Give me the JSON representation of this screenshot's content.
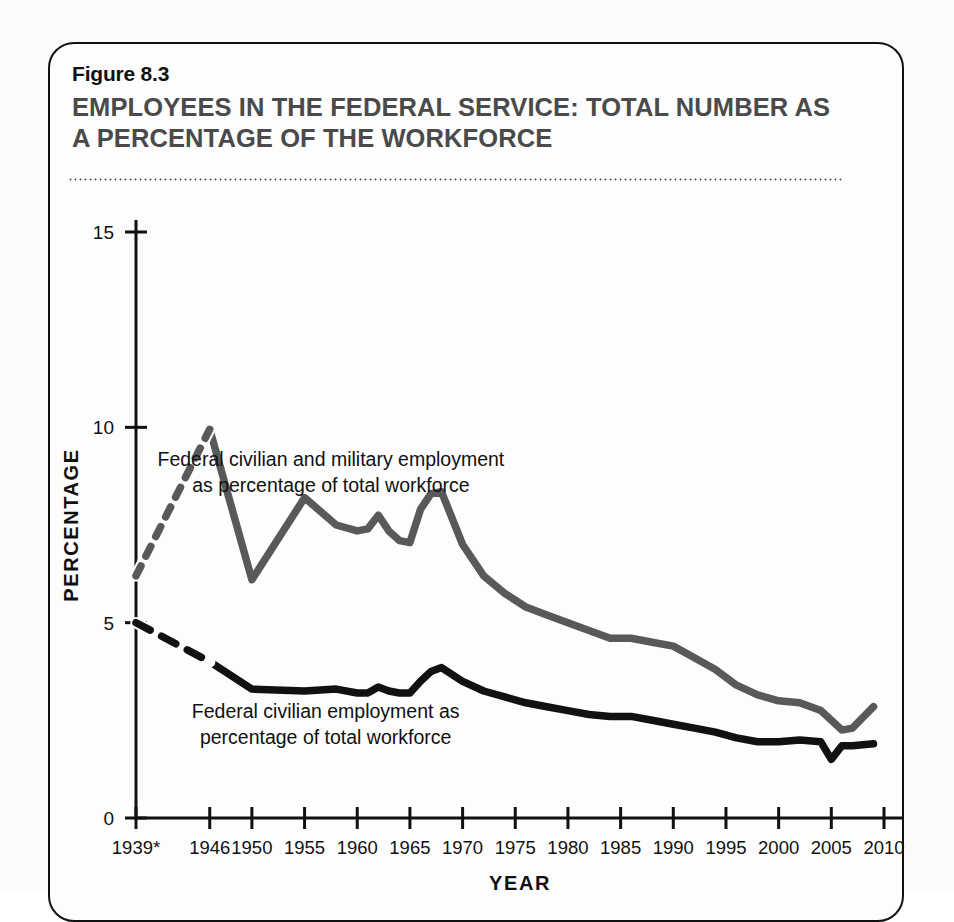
{
  "figure": {
    "number": "Figure 8.3",
    "title": "EMPLOYEES IN THE FEDERAL SERVICE: TOTAL NUMBER AS A PERCENTAGE OF THE WORKFORCE"
  },
  "colors": {
    "total_series": "#595959",
    "civilian_series": "#111111",
    "title_gray": "#4a4a4a",
    "axis": "#111111"
  },
  "chart_data": {
    "type": "line",
    "title": "EMPLOYEES IN THE FEDERAL SERVICE: TOTAL NUMBER AS A PERCENTAGE OF THE WORKFORCE",
    "subtitle": "Figure 8.3",
    "xlabel": "YEAR",
    "ylabel": "PERCENTAGE",
    "xlim": [
      1939,
      2010
    ],
    "ylim": [
      0,
      15
    ],
    "ytick_labels": [
      "0",
      "5",
      "10",
      "15"
    ],
    "yticks": [
      0,
      5,
      10,
      15
    ],
    "xtick_labels": [
      "1939*",
      "1946",
      "1950",
      "1955",
      "1960",
      "1965",
      "1970",
      "1975",
      "1980",
      "1985",
      "1990",
      "1995",
      "2000",
      "2005",
      "2010"
    ],
    "xticks": [
      1939,
      1946,
      1950,
      1955,
      1960,
      1965,
      1970,
      1975,
      1980,
      1985,
      1990,
      1995,
      2000,
      2005,
      2010
    ],
    "grid": false,
    "legend_position": "inline-annotation",
    "footnote_marker": "*",
    "annotations": [
      {
        "name": "total-series-label",
        "text_lines": [
          "Federal civilian and military employment",
          "as percentage of total workforce"
        ],
        "x": 1957.5,
        "y": 9.0
      },
      {
        "name": "civilian-series-label",
        "text_lines": [
          "Federal civilian employment as",
          "percentage of total workforce"
        ],
        "x": 1957.0,
        "y": 2.55
      }
    ],
    "series": [
      {
        "name": "Federal civilian and military employment as percentage of total workforce",
        "color": "#595959",
        "dashed_segment": {
          "from": 1939,
          "to": 1946
        },
        "x": [
          1939,
          1946,
          1950,
          1955,
          1958,
          1960,
          1961,
          1962,
          1963,
          1964,
          1965,
          1966,
          1967,
          1968,
          1970,
          1972,
          1974,
          1976,
          1978,
          1980,
          1982,
          1984,
          1986,
          1988,
          1990,
          1992,
          1994,
          1996,
          1998,
          2000,
          2002,
          2004,
          2006,
          2007,
          2009
        ],
        "values": [
          6.2,
          9.95,
          6.1,
          8.2,
          7.5,
          7.35,
          7.4,
          7.75,
          7.35,
          7.1,
          7.05,
          7.9,
          8.3,
          8.35,
          7.0,
          6.2,
          5.75,
          5.4,
          5.2,
          5.0,
          4.8,
          4.6,
          4.6,
          4.5,
          4.4,
          4.1,
          3.8,
          3.4,
          3.15,
          3.0,
          2.95,
          2.75,
          2.25,
          2.3,
          2.85
        ]
      },
      {
        "name": "Federal civilian employment as percentage of total workforce",
        "color": "#111111",
        "dashed_segment": {
          "from": 1939,
          "to": 1948
        },
        "x": [
          1939,
          1946,
          1950,
          1955,
          1958,
          1960,
          1961,
          1962,
          1963,
          1964,
          1965,
          1966,
          1967,
          1968,
          1970,
          1972,
          1974,
          1976,
          1978,
          1980,
          1982,
          1984,
          1986,
          1988,
          1990,
          1992,
          1994,
          1996,
          1998,
          2000,
          2002,
          2004,
          2005,
          2006,
          2007,
          2009
        ],
        "values": [
          5.0,
          4.0,
          3.3,
          3.25,
          3.3,
          3.2,
          3.2,
          3.35,
          3.25,
          3.2,
          3.2,
          3.5,
          3.75,
          3.85,
          3.5,
          3.25,
          3.1,
          2.95,
          2.85,
          2.75,
          2.65,
          2.6,
          2.6,
          2.5,
          2.4,
          2.3,
          2.2,
          2.05,
          1.95,
          1.95,
          2.0,
          1.95,
          1.5,
          1.85,
          1.85,
          1.9
        ]
      }
    ]
  }
}
